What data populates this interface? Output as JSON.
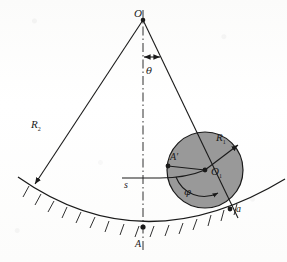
{
  "figure": {
    "background_color": "#fdfdfc",
    "ink_color": "#1a1a1a",
    "disk_fill_color": "#999999",
    "labels": {
      "apex_point": "O",
      "angle_theta": "θ",
      "outer_radius": "R",
      "outer_radius_subscript": "2",
      "disk_radius": "R",
      "disk_radius_subscript": "1",
      "disk_center": "O",
      "disk_center_subscript": "1",
      "arc_point": "A",
      "arc_point_prime": "A′",
      "arc_length": "s",
      "contact_point": "a",
      "angle_phi": "φ"
    },
    "geometry": {
      "apex": [
        143,
        19
      ],
      "disk_center": [
        205,
        170
      ],
      "disk_radius_px": 38,
      "bottom_point_A": [
        143,
        227
      ],
      "contact_point_a": [
        232,
        207
      ],
      "point_A_prime": [
        168,
        161
      ],
      "arc_left_end": [
        18,
        178
      ],
      "arc_right_end": [
        285,
        180
      ]
    }
  }
}
